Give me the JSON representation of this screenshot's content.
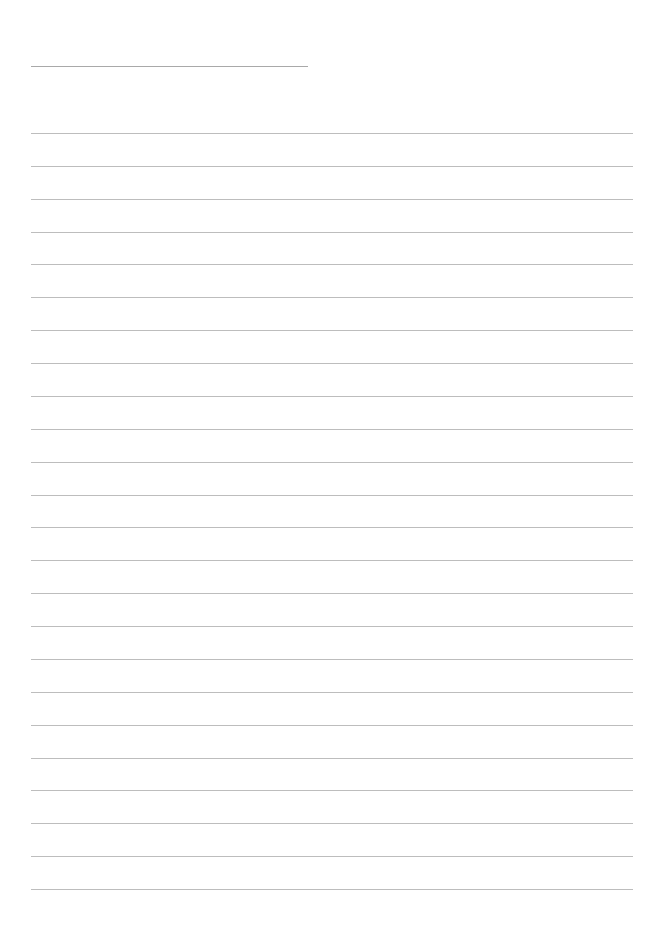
{
  "page": {
    "type": "blank ruled writing sheet",
    "background_color": "#ffffff",
    "line_color": "#bdbdbd"
  },
  "title_line": {
    "text": "",
    "x": 31,
    "y": 66,
    "width": 277
  },
  "ruled_lines": {
    "count": 24,
    "first_y": 133,
    "spacing": 32.87,
    "x": 31,
    "width": 602,
    "values": [
      "",
      "",
      "",
      "",
      "",
      "",
      "",
      "",
      "",
      "",
      "",
      "",
      "",
      "",
      "",
      "",
      "",
      "",
      "",
      "",
      "",
      "",
      "",
      ""
    ]
  }
}
